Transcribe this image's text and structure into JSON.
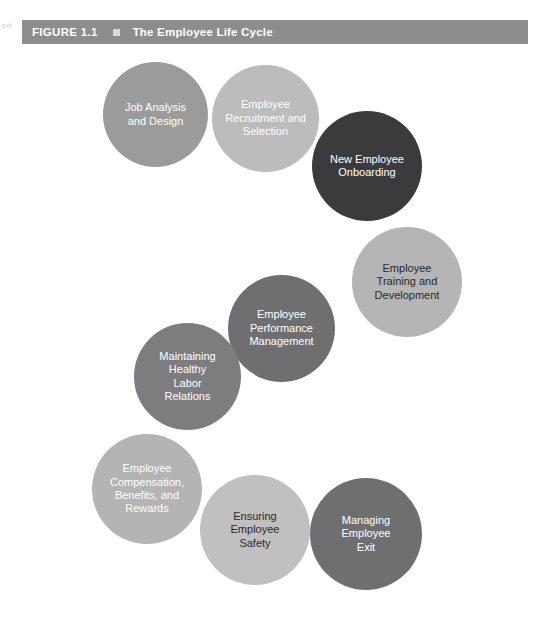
{
  "figure": {
    "number": "FIGURE 1.1",
    "bullet_icon": "square-bullet-icon",
    "title": "The Employee Life Cycle",
    "header_bg": "#8d8d8d",
    "header_text_color": "#ffffff",
    "margin_mark": "ext"
  },
  "diagram": {
    "type": "cycle",
    "background": "#ffffff",
    "stages": [
      {
        "index": 1,
        "label": "Job Analysis\nand Design",
        "color": "#9b9b9b",
        "text_color": "#ffffff",
        "x": 103,
        "y": 62,
        "size": 105
      },
      {
        "index": 2,
        "label": "Employee\nRecruitment and\nSelection",
        "color": "#bcbcbc",
        "text_color": "#ffffff",
        "x": 212,
        "y": 65,
        "size": 107
      },
      {
        "index": 3,
        "label": "New Employee\nOnboarding",
        "color": "#3b3b3d",
        "text_color": "#ffffff",
        "x": 312,
        "y": 111,
        "size": 110
      },
      {
        "index": 4,
        "label": "Employee\nTraining and\nDevelopment",
        "color": "#b5b5b5",
        "text_color": "#2a2a2a",
        "x": 352,
        "y": 227,
        "size": 110
      },
      {
        "index": 5,
        "label": "Employee\nPerformance\nManagement",
        "color": "#6f6f71",
        "text_color": "#ffffff",
        "x": 228,
        "y": 275,
        "size": 107
      },
      {
        "index": 6,
        "label": "Maintaining\nHealthy\nLabor\nRelations",
        "color": "#7d7d7f",
        "text_color": "#ffffff",
        "x": 134,
        "y": 323,
        "size": 107
      },
      {
        "index": 7,
        "label": "Employee\nCompensation,\nBenefits, and\nRewards",
        "color": "#b4b4b4",
        "text_color": "#ffffff",
        "x": 92,
        "y": 434,
        "size": 110
      },
      {
        "index": 8,
        "label": "Ensuring\nEmployee\nSafety",
        "color": "#c0c0c0",
        "text_color": "#2a2a2a",
        "x": 200,
        "y": 475,
        "size": 110
      },
      {
        "index": 9,
        "label": "Managing\nEmployee\nExit",
        "color": "#6f6f71",
        "text_color": "#ffffff",
        "x": 310,
        "y": 478,
        "size": 112
      }
    ]
  }
}
